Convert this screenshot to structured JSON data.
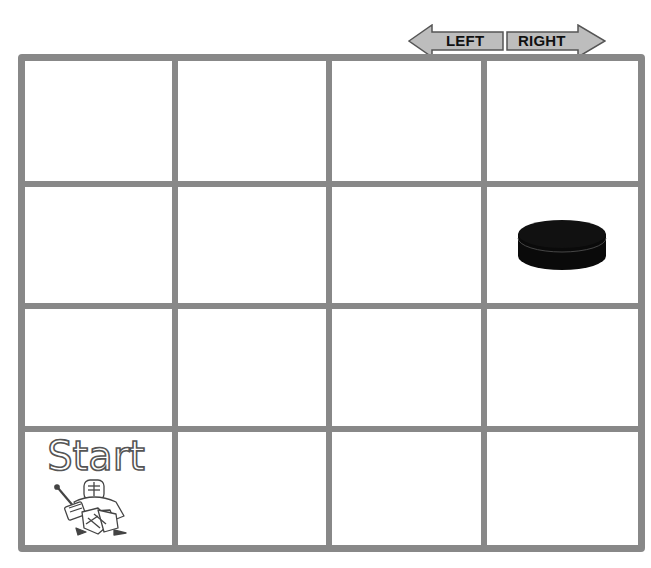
{
  "controls": {
    "left_label": "LEFT",
    "right_label": "RIGHT",
    "arrow_fill": "#bdbdbd",
    "arrow_stroke": "#555555"
  },
  "board": {
    "rows": 4,
    "cols": 4,
    "line_color": "#888888",
    "cells": [
      [
        {
          "content": ""
        },
        {
          "content": ""
        },
        {
          "content": ""
        },
        {
          "content": ""
        }
      ],
      [
        {
          "content": ""
        },
        {
          "content": ""
        },
        {
          "content": ""
        },
        {
          "content": "hockey-puck"
        }
      ],
      [
        {
          "content": ""
        },
        {
          "content": ""
        },
        {
          "content": ""
        },
        {
          "content": ""
        }
      ],
      [
        {
          "content": "start-goalie"
        },
        {
          "content": ""
        },
        {
          "content": ""
        },
        {
          "content": ""
        }
      ]
    ],
    "start_label": "Start",
    "start_cell": {
      "row": 4,
      "col": 1
    },
    "puck_cell": {
      "row": 2,
      "col": 4
    }
  }
}
